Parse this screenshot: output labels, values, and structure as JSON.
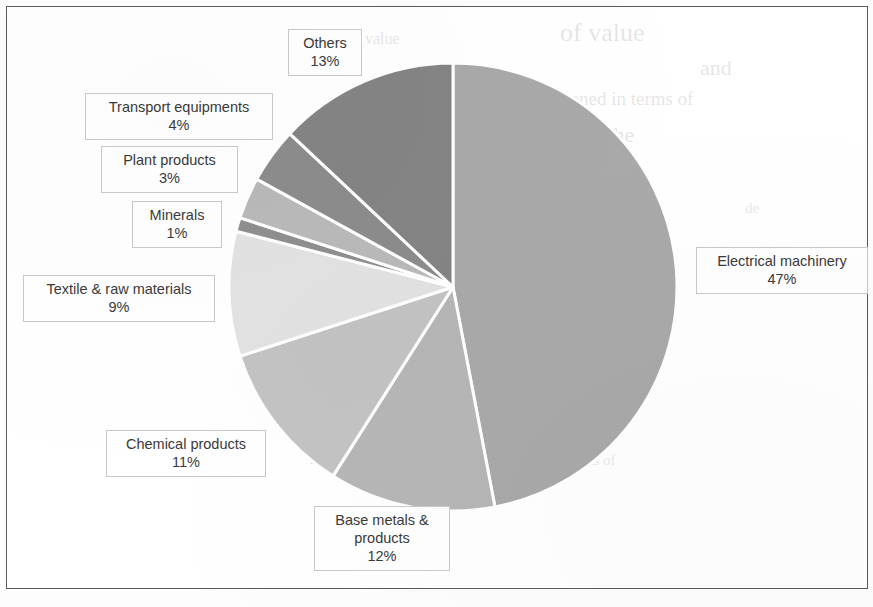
{
  "page": {
    "background_color": "#ffffff",
    "frame_color": "#5a5a5a"
  },
  "ghost_text": [
    {
      "text": "of value",
      "x": 560,
      "y": 18,
      "size": 26
    },
    {
      "text": "gh value",
      "x": 345,
      "y": 30,
      "size": 16
    },
    {
      "text": "and",
      "x": 700,
      "y": 55,
      "size": 22
    },
    {
      "text": "honed in terms of",
      "x": 560,
      "y": 88,
      "size": 19
    },
    {
      "text": "The",
      "x": 600,
      "y": 122,
      "size": 22
    },
    {
      "text": "the export",
      "x": 400,
      "y": 130,
      "size": 17
    },
    {
      "text": "de",
      "x": 745,
      "y": 200,
      "size": 15
    },
    {
      "text": "of",
      "x": 620,
      "y": 245,
      "size": 14
    },
    {
      "text": "ket",
      "x": 120,
      "y": 432,
      "size": 14
    },
    {
      "text": "production",
      "x": 310,
      "y": 448,
      "size": 15
    },
    {
      "text": "exports of",
      "x": 555,
      "y": 452,
      "size": 15
    }
  ],
  "chart_data": {
    "type": "pie",
    "title": "",
    "start_angle_deg": 0,
    "direction": "clockwise",
    "labels_suffix": "%",
    "legend_position": "callout-labels",
    "grid": false,
    "center": {
      "x": 453,
      "y": 287
    },
    "radius": 224,
    "categories": [
      "Electrical machinery",
      "Base metals & products",
      "Chemical products",
      "Textile & raw materials",
      "Minerals",
      "Plant products",
      "Transport equipments",
      "Others"
    ],
    "values": [
      47,
      12,
      11,
      9,
      1,
      3,
      4,
      13
    ],
    "colors": [
      "#a9a9a9",
      "#b6b6b6",
      "#c3c3c3",
      "#e2e2e2",
      "#8f8f8f",
      "#b9b9b9",
      "#8c8c8c",
      "#848484"
    ],
    "slices": [
      {
        "name": "Electrical machinery",
        "value": 47,
        "color": "#a9a9a9"
      },
      {
        "name": "Base metals & products",
        "value": 12,
        "color": "#b6b6b6"
      },
      {
        "name": "Chemical products",
        "value": 11,
        "color": "#c3c3c3"
      },
      {
        "name": "Textile & raw materials",
        "value": 9,
        "color": "#e2e2e2"
      },
      {
        "name": "Minerals",
        "value": 1,
        "color": "#8f8f8f"
      },
      {
        "name": "Plant products",
        "value": 3,
        "color": "#b9b9b9"
      },
      {
        "name": "Transport equipments",
        "value": 4,
        "color": "#8c8c8c"
      },
      {
        "name": "Others",
        "value": 13,
        "color": "#848484"
      }
    ]
  },
  "labels": [
    {
      "key": "others",
      "name": "Others",
      "percent": "13%",
      "x": 288,
      "y": 29,
      "width": 74,
      "align": "center"
    },
    {
      "key": "transport",
      "name": "Transport equipments",
      "percent": "4%",
      "x": 85,
      "y": 93,
      "width": 188,
      "align": "center"
    },
    {
      "key": "plant",
      "name": "Plant products",
      "percent": "3%",
      "x": 101,
      "y": 146,
      "width": 137,
      "align": "center"
    },
    {
      "key": "minerals",
      "name": "Minerals",
      "percent": "1%",
      "x": 132,
      "y": 201,
      "width": 90,
      "align": "center"
    },
    {
      "key": "textile",
      "name": "Textile & raw materials",
      "percent": "9%",
      "x": 23,
      "y": 275,
      "width": 192,
      "align": "center"
    },
    {
      "key": "chemical",
      "name": "Chemical products",
      "percent": "11%",
      "x": 106,
      "y": 430,
      "width": 160,
      "align": "center"
    },
    {
      "key": "basemetals",
      "name": "Base metals &",
      "name2": "products",
      "percent": "12%",
      "x": 314,
      "y": 506,
      "width": 136,
      "align": "center"
    },
    {
      "key": "electrical",
      "name": "Electrical machinery",
      "percent": "47%",
      "x": 696,
      "y": 247,
      "width": 172,
      "align": "center"
    }
  ]
}
